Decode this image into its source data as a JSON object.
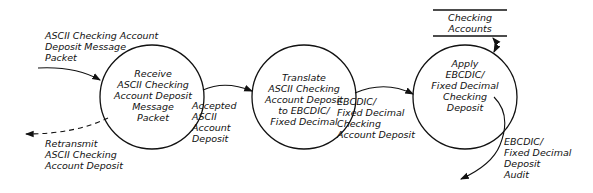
{
  "diagram": {
    "type": "data-flow-diagram",
    "processes": [
      {
        "id": "p1",
        "label": "Receive\nASCII Checking\nAccount Deposit\nMessage\nPacket"
      },
      {
        "id": "p2",
        "label": "Translate\nASCII Checking\nAccount Deposit\nto EBCDIC/\nFixed Decimal"
      },
      {
        "id": "p3",
        "label": "Apply\nEBCDIC/\nFixed Decimal\nChecking\nDeposit"
      }
    ],
    "data_store": {
      "label": "Checking\nAccounts"
    },
    "flows": [
      {
        "id": "f_in",
        "label": "ASCII Checking Account\nDeposit Message\nPacket",
        "to": "p1"
      },
      {
        "id": "f_retransmit",
        "label": "Retransmit\nASCII Checking\nAccount Deposit",
        "from": "p1",
        "style": "dashed"
      },
      {
        "id": "f_accepted",
        "label": "Accepted\nASCII\nAccount\nDeposit",
        "from": "p1",
        "to": "p2"
      },
      {
        "id": "f_translated",
        "label": "EBCDIC/\nFixed Decimal\nChecking\nAccount Deposit",
        "from": "p2",
        "to": "p3"
      },
      {
        "id": "f_store",
        "label": "",
        "between": [
          "p3",
          "data_store"
        ],
        "bidirectional": true
      },
      {
        "id": "f_audit",
        "label": "EBCDIC/\nFixed Decimal\nDeposit\nAudit",
        "from": "p3"
      }
    ]
  }
}
